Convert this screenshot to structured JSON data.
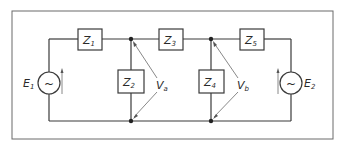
{
  "diagram": {
    "type": "circuit-schematic",
    "impedances": [
      {
        "id": "Z1",
        "letter": "Z",
        "sub": "1"
      },
      {
        "id": "Z2",
        "letter": "Z",
        "sub": "2"
      },
      {
        "id": "Z3",
        "letter": "Z",
        "sub": "3"
      },
      {
        "id": "Z4",
        "letter": "Z",
        "sub": "4"
      },
      {
        "id": "Z5",
        "letter": "Z",
        "sub": "5"
      }
    ],
    "sources": [
      {
        "id": "E1",
        "letter": "E",
        "sub": "1",
        "symbol": "~"
      },
      {
        "id": "E2",
        "letter": "E",
        "sub": "2",
        "symbol": "~"
      }
    ],
    "voltages": [
      {
        "id": "Va",
        "letter": "V",
        "sub": "a"
      },
      {
        "id": "Vb",
        "letter": "V",
        "sub": "b"
      }
    ],
    "colors": {
      "line": "#3a3a3a",
      "frame": "#6a6a6a",
      "arrow": "#7a7a7a"
    }
  }
}
